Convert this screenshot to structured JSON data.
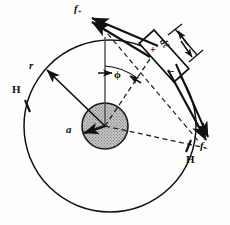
{
  "figure": {
    "geometry": {
      "outer_circle": {
        "cx": 110,
        "cy": 126,
        "r": 86,
        "label": "H"
      },
      "inner_circle": {
        "cx": 105,
        "cy": 126,
        "r": 23,
        "label": "a",
        "fill": "stippled-gray"
      },
      "radius_line_label": "r",
      "angle_label": "ϕ",
      "angle_from": "vertical reference line",
      "element_length_label": "dℓ"
    },
    "labels": {
      "force_plus": {
        "symbol": "f",
        "subscript": "+"
      },
      "force_minus": {
        "symbol": "f",
        "subscript": "−"
      },
      "field_left": "H",
      "field_right": "H",
      "radius": "r",
      "core_radius": "a",
      "angle": "ϕ",
      "element_length": "dℓ",
      "pole_positive": "+",
      "pole_negative": "−"
    },
    "colors": {
      "stroke": "#111111",
      "fill_core": "#b9b9b9",
      "background": "#ffffff",
      "dashed": "#222222"
    }
  }
}
